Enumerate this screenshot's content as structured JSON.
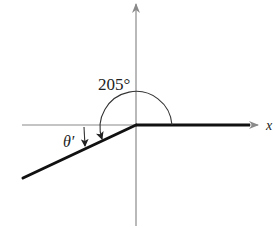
{
  "diagram": {
    "type": "reference-angle",
    "angle_label": "205°",
    "reference_angle_label": "θ′",
    "x_axis_label": "x",
    "angle_degrees": 205,
    "colors": {
      "axis": "#8a8a8a",
      "ray": "#111111",
      "arc": "#333333",
      "text": "#222222"
    }
  }
}
